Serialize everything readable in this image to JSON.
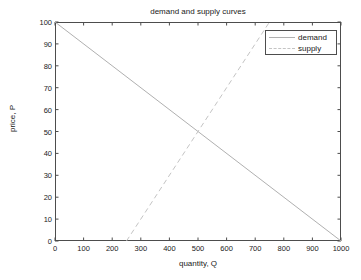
{
  "chart_data": {
    "type": "line",
    "title": "demand and supply curves",
    "xlabel": "quantity, Q",
    "ylabel": "price, P",
    "xlim": [
      0,
      1000
    ],
    "ylim": [
      0,
      100
    ],
    "xticks": [
      0,
      100,
      200,
      300,
      400,
      500,
      600,
      700,
      800,
      900,
      1000
    ],
    "yticks": [
      0,
      10,
      20,
      30,
      40,
      50,
      60,
      70,
      80,
      90,
      100
    ],
    "grid": false,
    "legend_position": "top-right",
    "series": [
      {
        "name": "demand",
        "style": "solid",
        "color": "#b0b0b0",
        "x": [
          0,
          1000
        ],
        "y": [
          100,
          0
        ]
      },
      {
        "name": "supply",
        "style": "dashed",
        "color": "#c4c4c4",
        "x": [
          250,
          750
        ],
        "y": [
          0,
          100
        ]
      }
    ],
    "equilibrium": {
      "quantity": 500,
      "price": 50
    }
  },
  "legend": {
    "items": [
      {
        "label": "demand"
      },
      {
        "label": "supply"
      }
    ]
  },
  "axis": {
    "x_tick_labels": [
      "0",
      "100",
      "200",
      "300",
      "400",
      "500",
      "600",
      "700",
      "800",
      "900",
      "1000"
    ],
    "y_tick_labels": [
      "0",
      "10",
      "20",
      "30",
      "40",
      "50",
      "60",
      "70",
      "80",
      "90",
      "100"
    ]
  }
}
